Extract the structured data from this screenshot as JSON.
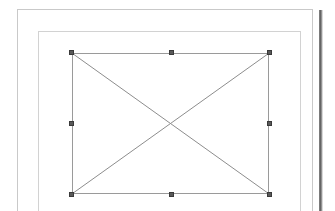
{
  "app": {
    "view_name": "Page Layout View",
    "background_color": "#ffffff"
  },
  "canvas": {
    "width": 335,
    "height": 211
  },
  "page": {
    "label": "Document Page",
    "border_color": "#c9c9c9",
    "fill_color": "#ffffff",
    "x": 17,
    "y": 9,
    "width": 296,
    "height": 210
  },
  "margin_guide": {
    "label": "Text Area Boundary",
    "border_color": "#d2d2d2",
    "x": 37,
    "y": 30,
    "width": 263,
    "height": 190
  },
  "page_shadow": {
    "label": "Page Edge Shadow",
    "color": "#5e5e5e",
    "x": 319,
    "y": 10,
    "width": 3,
    "height": 201
  },
  "selected_object": {
    "type": "image-placeholder",
    "label": "Empty Image Frame",
    "alt_text": "",
    "state": "selected",
    "border_color": "#9a9a9a",
    "cross_color": "#8d8d8d",
    "fill_color": "#ffffff",
    "x": 71,
    "y": 52,
    "width": 197,
    "height": 141,
    "handles": [
      {
        "id": "nw",
        "label": "Resize Top Left",
        "cursor": "nwse-resize"
      },
      {
        "id": "n",
        "label": "Resize Top Center",
        "cursor": "ns-resize"
      },
      {
        "id": "ne",
        "label": "Resize Top Right",
        "cursor": "nesw-resize"
      },
      {
        "id": "w",
        "label": "Resize Middle Left",
        "cursor": "ew-resize"
      },
      {
        "id": "e",
        "label": "Resize Middle Right",
        "cursor": "ew-resize"
      },
      {
        "id": "sw",
        "label": "Resize Bottom Left",
        "cursor": "nesw-resize"
      },
      {
        "id": "s",
        "label": "Resize Bottom Center",
        "cursor": "ns-resize"
      },
      {
        "id": "se",
        "label": "Resize Bottom Right",
        "cursor": "nwse-resize"
      }
    ],
    "handle_color": "#595959",
    "handle_border_color": "#3a3a3a"
  }
}
